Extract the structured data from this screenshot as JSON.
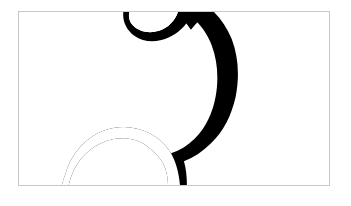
{
  "image": {
    "title": "Abstract black and white organic shape",
    "alt_text": "A framed rectangular panel divided by a sinuous curve: a large black region fills the left side, a white region fills the right side, with a narrow white channel and a hooked crescent near the top edge and a mirrored arc near the bottom edge.",
    "medium": "high-contrast two-tone graphic",
    "orientation": "landscape"
  },
  "frame": {
    "border_color": "#c8c8c8",
    "border_width_px": 1,
    "x_px": 18,
    "y_px": 11,
    "width_px": 312,
    "height_px": 175
  },
  "page": {
    "background_color": "#ffffff",
    "width_px": 351,
    "height_px": 206
  },
  "palette": {
    "foreground": "#000000",
    "background": "#ffffff",
    "frame_line": "#c8c8c8"
  },
  "shapes": {
    "black_mass": {
      "name": "black-organic-mass",
      "fill": "#000000",
      "description": "Large black field anchored to the left, top and bottom edges, bulging rightward to roughly 63% of the panel width at mid height."
    },
    "top_crescent": {
      "name": "top-white-crescent",
      "fill": "#ffffff",
      "description": "Hook shaped white notch cutting into the black mass just below the top edge, curling leftward."
    },
    "bottom_arc": {
      "name": "bottom-white-arc",
      "fill": "#ffffff",
      "description": "White arc sweeping from the lower left toward the bottom right, mirroring the top crescent."
    },
    "white_field": {
      "name": "white-right-field",
      "fill": "#ffffff",
      "description": "Plain white region occupying the right portion of the panel."
    }
  }
}
